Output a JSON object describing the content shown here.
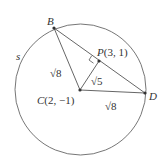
{
  "diagram": {
    "circle": {
      "label": "s",
      "center_ref": "C",
      "radius_label": "√8"
    },
    "points": [
      {
        "id": "B",
        "label": "B"
      },
      {
        "id": "P",
        "label": "P(3, 1)"
      },
      {
        "id": "C",
        "label": "C(2, −1)"
      },
      {
        "id": "D",
        "label": "D"
      }
    ],
    "segments": [
      {
        "from": "C",
        "to": "B",
        "label": "√8"
      },
      {
        "from": "C",
        "to": "P",
        "label": "√5"
      },
      {
        "from": "C",
        "to": "D",
        "label": "√8"
      },
      {
        "from": "B",
        "to": "D",
        "label": ""
      }
    ],
    "right_angle_at": "P",
    "colors": {
      "stroke": "#555555",
      "text": "#333333",
      "background": "#ffffff"
    }
  }
}
